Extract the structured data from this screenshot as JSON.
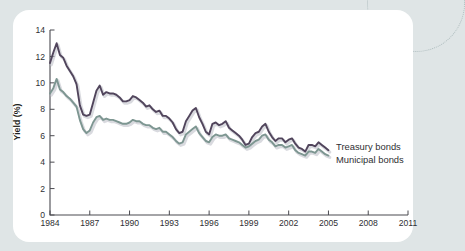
{
  "figure": {
    "background_color": "#dfe5e6",
    "card_color": "#ffffff",
    "axis_color": "#4a4a50"
  },
  "legend": {
    "treasury_label": "Treasury bonds",
    "municipal_label": "Municipal bonds"
  },
  "axes": {
    "ylabel": "Yield (%)",
    "xlabel": ""
  },
  "chart_data": {
    "type": "line",
    "title": "",
    "xlabel": "",
    "ylabel": "Yield (%)",
    "xlim": [
      1984,
      2011
    ],
    "ylim": [
      0,
      14
    ],
    "xticks": [
      1984,
      1987,
      1990,
      1993,
      1996,
      1999,
      2002,
      2005,
      2008,
      2011
    ],
    "yticks": [
      0,
      2,
      4,
      6,
      8,
      10,
      12,
      14
    ],
    "grid": false,
    "legend_position": "right-inline-at-line-ends",
    "colors": {
      "Treasury bonds": "#51455c",
      "Municipal bonds": "#7d9691"
    },
    "x": [
      1984.0,
      1984.25,
      1984.5,
      1984.75,
      1985.0,
      1985.25,
      1985.5,
      1985.75,
      1986.0,
      1986.25,
      1986.5,
      1986.75,
      1987.0,
      1987.25,
      1987.5,
      1987.75,
      1988.0,
      1988.25,
      1988.5,
      1988.75,
      1989.0,
      1989.25,
      1989.5,
      1989.75,
      1990.0,
      1990.25,
      1990.5,
      1990.75,
      1991.0,
      1991.25,
      1991.5,
      1991.75,
      1992.0,
      1992.25,
      1992.5,
      1992.75,
      1993.0,
      1993.25,
      1993.5,
      1993.75,
      1994.0,
      1994.25,
      1994.5,
      1994.75,
      1995.0,
      1995.25,
      1995.5,
      1995.75,
      1996.0,
      1996.25,
      1996.5,
      1996.75,
      1997.0,
      1997.25,
      1997.5,
      1997.75,
      1998.0,
      1998.25,
      1998.5,
      1998.75,
      1999.0,
      1999.25,
      1999.5,
      1999.75,
      2000.0,
      2000.25,
      2000.5,
      2000.75,
      2001.0,
      2001.25,
      2001.5,
      2001.75,
      2002.0,
      2002.25,
      2002.5,
      2002.75,
      2003.0,
      2003.25,
      2003.5,
      2003.75,
      2004.0,
      2004.25,
      2004.5,
      2004.75,
      2005.0
    ],
    "series": [
      {
        "name": "Treasury bonds",
        "color": "#51455c",
        "values": [
          11.5,
          12.3,
          13.0,
          12.1,
          11.9,
          11.3,
          10.9,
          10.5,
          9.9,
          8.3,
          7.6,
          7.5,
          7.6,
          8.5,
          9.4,
          9.8,
          9.1,
          9.3,
          9.2,
          9.2,
          9.1,
          8.9,
          8.6,
          8.6,
          8.7,
          9.0,
          8.9,
          8.7,
          8.5,
          8.2,
          8.3,
          8.0,
          7.8,
          7.9,
          7.5,
          7.5,
          7.3,
          7.0,
          6.5,
          6.2,
          6.3,
          7.1,
          7.5,
          7.9,
          8.1,
          7.4,
          6.9,
          6.3,
          6.1,
          6.9,
          7.0,
          6.8,
          6.9,
          7.1,
          6.6,
          6.4,
          6.2,
          6.0,
          5.7,
          5.3,
          5.4,
          5.9,
          6.2,
          6.3,
          6.7,
          6.9,
          6.3,
          5.9,
          5.6,
          5.8,
          5.8,
          5.5,
          5.7,
          5.8,
          5.4,
          5.1,
          5.0,
          4.8,
          5.3,
          5.3,
          5.2,
          5.5,
          5.3,
          5.1,
          4.9
        ]
      },
      {
        "name": "Municipal bonds",
        "color": "#7d9691",
        "values": [
          9.2,
          9.6,
          10.3,
          9.5,
          9.3,
          9.0,
          8.8,
          8.5,
          8.2,
          7.2,
          6.5,
          6.2,
          6.4,
          7.0,
          7.4,
          7.5,
          7.2,
          7.3,
          7.2,
          7.2,
          7.1,
          7.0,
          6.9,
          6.9,
          7.0,
          7.2,
          7.1,
          7.1,
          6.9,
          6.8,
          6.8,
          6.6,
          6.5,
          6.6,
          6.3,
          6.3,
          6.1,
          5.9,
          5.6,
          5.4,
          5.5,
          6.1,
          6.3,
          6.5,
          6.7,
          6.2,
          5.9,
          5.6,
          5.5,
          5.9,
          6.1,
          6.0,
          6.0,
          6.1,
          5.8,
          5.7,
          5.6,
          5.5,
          5.3,
          5.1,
          5.2,
          5.4,
          5.6,
          5.7,
          6.0,
          6.1,
          5.7,
          5.5,
          5.2,
          5.3,
          5.3,
          5.1,
          5.2,
          5.3,
          4.9,
          4.7,
          4.6,
          4.5,
          4.8,
          4.8,
          4.7,
          5.0,
          4.8,
          4.6,
          4.5
        ]
      }
    ]
  }
}
